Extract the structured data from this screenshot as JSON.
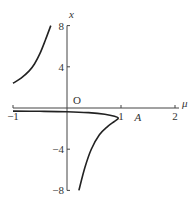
{
  "chart_data": {
    "type": "line",
    "title": "",
    "xlabel": "μ",
    "ylabel": "x",
    "xlim": [
      -1,
      2
    ],
    "ylim": [
      -8,
      8
    ],
    "grid": false,
    "x_ticks": [
      {
        "value": -1,
        "label": "-1"
      },
      {
        "value": 1,
        "label": "1"
      },
      {
        "value": 2,
        "label": "2"
      }
    ],
    "y_ticks": [
      {
        "value": 8,
        "label": "8"
      },
      {
        "value": 4,
        "label": "4"
      },
      {
        "value": -4,
        "label": "-4"
      },
      {
        "value": -8,
        "label": "-8"
      }
    ],
    "origin_label": "O",
    "annotations": [
      {
        "text": "A",
        "x": 1.25,
        "y": -0.9
      }
    ],
    "series": [
      {
        "name": "upper-branch",
        "points": [
          [
            -1,
            2.4
          ],
          [
            -0.85,
            2.9
          ],
          [
            -0.7,
            3.6
          ],
          [
            -0.6,
            4.3
          ],
          [
            -0.5,
            5.3
          ],
          [
            -0.4,
            6.6
          ],
          [
            -0.3,
            8
          ]
        ]
      },
      {
        "name": "lower-branch",
        "points": [
          [
            -1,
            -0.3
          ],
          [
            -0.5,
            -0.32
          ],
          [
            0,
            -0.36
          ],
          [
            0.4,
            -0.45
          ],
          [
            0.7,
            -0.6
          ],
          [
            0.88,
            -0.8
          ],
          [
            0.95,
            -1.0
          ],
          [
            0.88,
            -1.3
          ],
          [
            0.75,
            -1.8
          ],
          [
            0.6,
            -2.6
          ],
          [
            0.45,
            -4
          ],
          [
            0.33,
            -5.8
          ],
          [
            0.22,
            -8
          ]
        ]
      }
    ]
  }
}
